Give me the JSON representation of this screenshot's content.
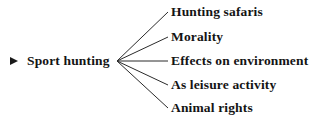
{
  "diagram": {
    "type": "radial-branch-tree",
    "background_color": "#ffffff",
    "line_color": "#2b2b2b",
    "text_color": "#141414",
    "root": {
      "label": "Sport hunting",
      "bullet_icon": "right-pointing-triangle-bullet"
    },
    "vertex": {
      "x": 117,
      "y": 61
    },
    "branches": [
      {
        "label": "Hunting safaris",
        "line": {
          "x1": 117,
          "y1": 61,
          "x2": 168,
          "y2": 12
        }
      },
      {
        "label": "Morality",
        "line": {
          "x1": 117,
          "y1": 61,
          "x2": 168,
          "y2": 37
        }
      },
      {
        "label": "Effects on environment",
        "line": {
          "x1": 117,
          "y1": 61,
          "x2": 168,
          "y2": 61
        }
      },
      {
        "label": "As leisure activity",
        "line": {
          "x1": 117,
          "y1": 61,
          "x2": 168,
          "y2": 85
        }
      },
      {
        "label": "Animal rights",
        "line": {
          "x1": 117,
          "y1": 61,
          "x2": 168,
          "y2": 108
        }
      }
    ]
  }
}
